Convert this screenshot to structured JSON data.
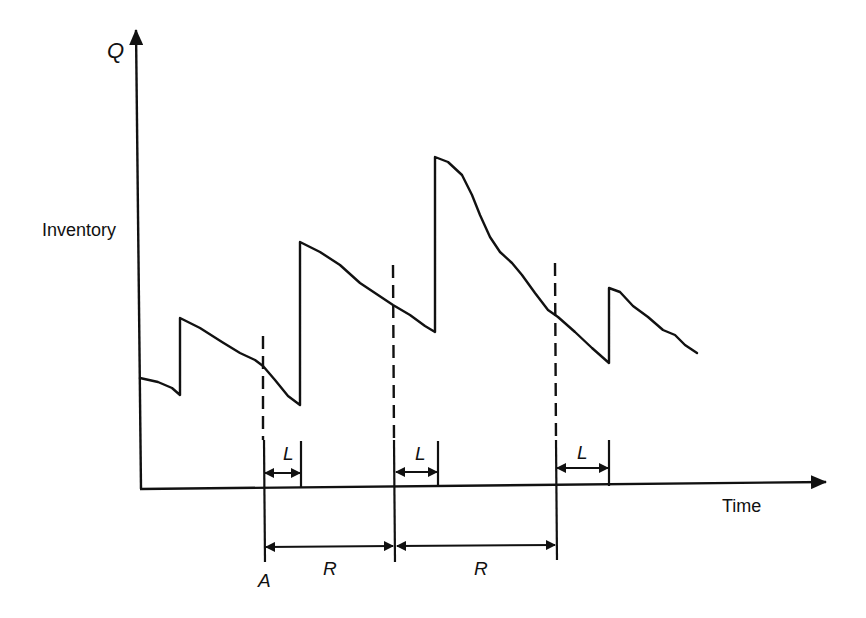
{
  "diagram": {
    "type": "periodic-review inventory diagram",
    "y_axis": {
      "label": "Q",
      "title": "Inventory"
    },
    "x_axis": {
      "title": "Time"
    },
    "review_point_label": "A",
    "lead_time_label": "L",
    "review_period_label": "R",
    "lead_time_intervals": [
      {
        "label": "L",
        "start_x": 264,
        "end_x": 301
      },
      {
        "label": "L",
        "start_x": 395,
        "end_x": 438
      },
      {
        "label": "L",
        "start_x": 556,
        "end_x": 609
      }
    ],
    "review_intervals": [
      {
        "label": "R",
        "start_x": 264,
        "end_x": 395
      },
      {
        "label": "R",
        "start_x": 395,
        "end_x": 556
      }
    ],
    "inventory_curve_points": [
      [
        140,
        378
      ],
      [
        158,
        382
      ],
      [
        172,
        388
      ],
      [
        180,
        395
      ],
      [
        180,
        318
      ],
      [
        200,
        328
      ],
      [
        222,
        342
      ],
      [
        240,
        353
      ],
      [
        255,
        360
      ],
      [
        263,
        366
      ],
      [
        275,
        380
      ],
      [
        288,
        396
      ],
      [
        300,
        405
      ],
      [
        300,
        242
      ],
      [
        320,
        252
      ],
      [
        340,
        265
      ],
      [
        360,
        283
      ],
      [
        378,
        295
      ],
      [
        393,
        305
      ],
      [
        410,
        315
      ],
      [
        425,
        326
      ],
      [
        435,
        332
      ],
      [
        435,
        157
      ],
      [
        448,
        162
      ],
      [
        462,
        175
      ],
      [
        472,
        195
      ],
      [
        480,
        215
      ],
      [
        490,
        237
      ],
      [
        500,
        252
      ],
      [
        512,
        263
      ],
      [
        522,
        275
      ],
      [
        535,
        293
      ],
      [
        548,
        310
      ],
      [
        558,
        317
      ],
      [
        575,
        332
      ],
      [
        592,
        348
      ],
      [
        609,
        363
      ],
      [
        609,
        288
      ],
      [
        620,
        292
      ],
      [
        633,
        306
      ],
      [
        648,
        317
      ],
      [
        663,
        330
      ],
      [
        675,
        335
      ],
      [
        685,
        345
      ],
      [
        697,
        353
      ]
    ],
    "colors": {
      "stroke": "#111111",
      "background": "#ffffff"
    }
  }
}
